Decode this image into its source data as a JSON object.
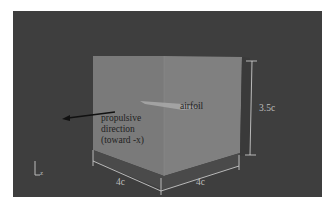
{
  "figure": {
    "type": "3d-domain-schematic",
    "background_color": "#3e3e3e",
    "box_front_color": "#7c7c7c",
    "box_side_color": "#808080",
    "box_bottom_color": "#4a4a4a",
    "dimension_line_color": "#d8d8d8"
  },
  "labels": {
    "airfoil": "airfoil",
    "propulsive_line1": "propulsive",
    "propulsive_line2": "direction",
    "propulsive_line3": "(toward -x)",
    "height_dim": "3.5c",
    "depth_dim": "4c",
    "width_dim": "4c",
    "axis_z": "z"
  }
}
